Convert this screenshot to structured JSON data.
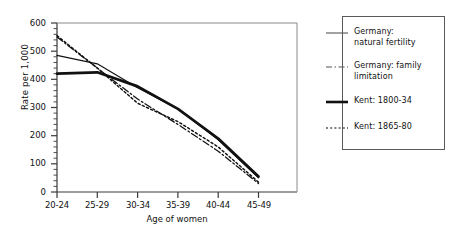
{
  "chart_data": {
    "type": "line",
    "title": "",
    "xlabel": "Age of women",
    "ylabel": "Rate per 1,000",
    "categories": [
      "20-24",
      "25-29",
      "30-34",
      "35-39",
      "40-44",
      "45-49"
    ],
    "ylim": [
      0,
      600
    ],
    "yticks": [
      0,
      100,
      200,
      300,
      400,
      500,
      600
    ],
    "ytick_labels": [
      "0",
      "100",
      "200",
      "300",
      "400",
      "500",
      "600"
    ],
    "y_minor_ticks": true,
    "grid": false,
    "legend_position": "right-outside",
    "series": [
      {
        "name": "Germany: natural fertility",
        "style": "solid-thin",
        "color": "#111111",
        "values": [
          485,
          455,
          370,
          295,
          185,
          50
        ]
      },
      {
        "name": "Germany: family limitation",
        "style": "dash-dot",
        "color": "#111111",
        "values": [
          550,
          440,
          330,
          240,
          145,
          30
        ]
      },
      {
        "name": "Kent: 1800-34",
        "style": "solid-thick",
        "color": "#111111",
        "values": [
          420,
          425,
          375,
          295,
          190,
          55
        ]
      },
      {
        "name": "Kent: 1865-80",
        "style": "dotted",
        "color": "#111111",
        "values": [
          555,
          440,
          315,
          250,
          160,
          35
        ]
      }
    ]
  },
  "legend": {
    "entries": [
      {
        "line1": "Germany:",
        "line2": "natural fertility"
      },
      {
        "line1": "Germany: family",
        "line2": "limitation"
      },
      {
        "line1": "Kent: 1800-34",
        "line2": ""
      },
      {
        "line1": "Kent: 1865-80",
        "line2": ""
      }
    ]
  },
  "axis": {
    "y_title": "Rate per 1,000",
    "x_title": "Age of women",
    "y_labels": [
      "600",
      "500",
      "400",
      "300",
      "200",
      "100",
      "0"
    ],
    "x_labels": [
      "20-24",
      "25-29",
      "30-34",
      "35-39",
      "40-44",
      "45-49"
    ]
  }
}
